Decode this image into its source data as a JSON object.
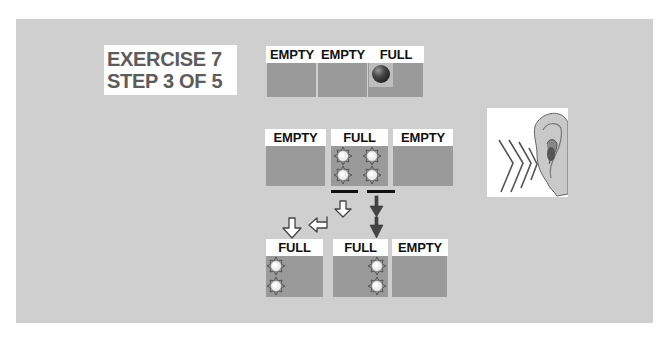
{
  "title": {
    "line1": "EXERCISE 7",
    "line2": "STEP 3 OF 5"
  },
  "top_row": [
    {
      "label": "EMPTY"
    },
    {
      "label": "EMPTY"
    },
    {
      "label": "FULL",
      "content": "dark-ball"
    }
  ],
  "middle_row": [
    {
      "label": "EMPTY"
    },
    {
      "label": "FULL",
      "content": "four-atoms"
    },
    {
      "label": "EMPTY"
    }
  ],
  "bottom_row": [
    {
      "label": "FULL",
      "content": "two-atoms-left"
    },
    {
      "label": "FULL",
      "content": "two-atoms-right"
    },
    {
      "label": "EMPTY"
    }
  ],
  "icons": {
    "ear": "ear-listening-icon",
    "arrows_white": "outlined-arrows-down-left",
    "arrows_dark": "dark-down-arrows"
  },
  "colors": {
    "panel": "#cfcfcf",
    "box": "#9a9a9a",
    "label_bg": "#ffffff",
    "title_text": "#5c5c5c"
  }
}
